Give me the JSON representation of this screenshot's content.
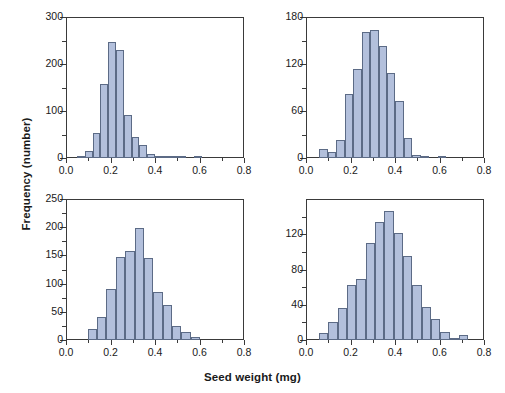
{
  "figure": {
    "xlabel": "Seed weight (mg)",
    "ylabel": "Frequency (number)",
    "bar_fill": "#b3c0dc",
    "bar_stroke": "#5c6b86",
    "axis_color": "#3a3a3a"
  },
  "chart_data": [
    {
      "type": "bar",
      "panel": "a",
      "title": "(a) Eden Valley 2002",
      "xlabel": "Seed weight (mg)",
      "ylabel": "Frequency (number)",
      "xlim": [
        0.0,
        0.8
      ],
      "ylim": [
        0,
        300
      ],
      "xticks": [
        0.0,
        0.2,
        0.4,
        0.6,
        0.8
      ],
      "xticklabels": [
        "0.0",
        "0.2",
        "0.4",
        "0.6",
        "0.8"
      ],
      "xticks_minor": [
        0.1,
        0.3,
        0.5,
        0.7
      ],
      "yticks": [
        0,
        100,
        200,
        300
      ],
      "yticklabels": [
        "0",
        "100",
        "200",
        "300"
      ],
      "yticks_minor": [
        50,
        150,
        250
      ],
      "bin_width": 0.035,
      "bin_starts": [
        0.05,
        0.085,
        0.12,
        0.155,
        0.19,
        0.225,
        0.26,
        0.295,
        0.33,
        0.365,
        0.4,
        0.435,
        0.47,
        0.505,
        0.54,
        0.575
      ],
      "values": [
        5,
        14,
        54,
        157,
        246,
        230,
        92,
        44,
        28,
        9,
        2,
        1,
        4,
        1,
        0,
        2
      ],
      "grid": false,
      "legend": null
    },
    {
      "type": "bar",
      "panel": "b",
      "title": "(b) Eden Valley 2003",
      "xlabel": "Seed weight (mg)",
      "ylabel": "Frequency (number)",
      "xlim": [
        0.0,
        0.8
      ],
      "ylim": [
        0,
        180
      ],
      "xticks": [
        0.0,
        0.2,
        0.4,
        0.6,
        0.8
      ],
      "xticklabels": [
        "0.0",
        "0.2",
        "0.4",
        "0.6",
        "0.8"
      ],
      "xticks_minor": [
        0.1,
        0.3,
        0.5,
        0.7
      ],
      "yticks": [
        0,
        60,
        120,
        180
      ],
      "yticklabels": [
        "0",
        "60",
        "120",
        "180"
      ],
      "yticks_minor": [
        30,
        90,
        150
      ],
      "bin_width": 0.038,
      "bin_starts": [
        0.06,
        0.098,
        0.136,
        0.174,
        0.212,
        0.25,
        0.288,
        0.326,
        0.364,
        0.402,
        0.44,
        0.478,
        0.516,
        0.554,
        0.592
      ],
      "values": [
        11,
        8,
        23,
        82,
        113,
        161,
        163,
        143,
        109,
        73,
        26,
        4,
        1,
        0,
        1
      ],
      "grid": false,
      "legend": null
    },
    {
      "type": "bar",
      "panel": "c",
      "title": "(c) Battle Mountain 2002",
      "xlabel": "Seed weight (mg)",
      "ylabel": "Frequency (number)",
      "xlim": [
        0.0,
        0.8
      ],
      "ylim": [
        0,
        250
      ],
      "xticks": [
        0.0,
        0.2,
        0.4,
        0.6,
        0.8
      ],
      "xticklabels": [
        "0.0",
        "0.2",
        "0.4",
        "0.6",
        "0.8"
      ],
      "xticks_minor": [
        0.1,
        0.3,
        0.5,
        0.7
      ],
      "yticks": [
        0,
        50,
        100,
        150,
        200,
        250
      ],
      "yticklabels": [
        "0",
        "50",
        "100",
        "150",
        "200",
        "250"
      ],
      "yticks_minor": [
        25,
        75,
        125,
        175,
        225
      ],
      "bin_width": 0.042,
      "bin_starts": [
        0.098,
        0.14,
        0.182,
        0.224,
        0.266,
        0.308,
        0.35,
        0.392,
        0.434,
        0.476,
        0.518,
        0.56
      ],
      "values": [
        19,
        40,
        91,
        148,
        158,
        198,
        146,
        86,
        62,
        25,
        14,
        5
      ],
      "grid": false,
      "legend": null
    },
    {
      "type": "bar",
      "panel": "d",
      "title": "(d) Battle Mountain 2003",
      "xlabel": "Seed weight (mg)",
      "ylabel": "Frequency (number)",
      "xlim": [
        0.0,
        0.8
      ],
      "ylim": [
        0,
        160
      ],
      "xticks": [
        0.0,
        0.2,
        0.4,
        0.6,
        0.8
      ],
      "xticklabels": [
        "0.0",
        "0.2",
        "0.4",
        "0.6",
        "0.8"
      ],
      "xticks_minor": [
        0.1,
        0.3,
        0.5,
        0.7
      ],
      "yticks": [
        0,
        40,
        80,
        120
      ],
      "yticklabels": [
        "0",
        "40",
        "80",
        "120"
      ],
      "yticks_minor": [
        20,
        60,
        100,
        140
      ],
      "bin_width": 0.042,
      "bin_starts": [
        0.058,
        0.1,
        0.142,
        0.184,
        0.226,
        0.268,
        0.31,
        0.352,
        0.394,
        0.436,
        0.478,
        0.52,
        0.562,
        0.604,
        0.646,
        0.688
      ],
      "values": [
        8,
        20,
        36,
        62,
        69,
        110,
        134,
        146,
        121,
        95,
        62,
        37,
        24,
        9,
        2,
        6
      ],
      "grid": false,
      "legend": null
    }
  ]
}
